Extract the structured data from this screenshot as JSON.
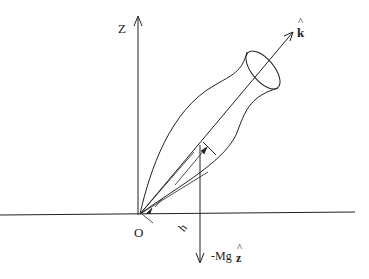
{
  "diagram": {
    "labels": {
      "z_axis": "Z",
      "symmetry_axis": "k",
      "symmetry_axis_hat": "^",
      "origin": "O",
      "distance": "h",
      "gravity_force": "-Mg",
      "gravity_unit": "z",
      "gravity_unit_hat": "^"
    },
    "colors": {
      "stroke": "#222222",
      "background": "#ffffff"
    }
  }
}
